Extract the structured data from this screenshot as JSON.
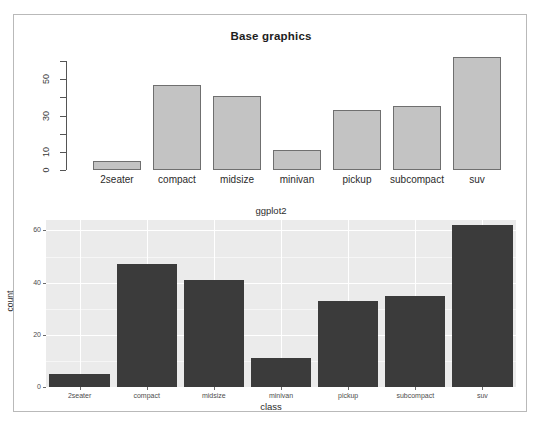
{
  "figure": {
    "background": "#ffffff",
    "frame_color": "#b9b9b9"
  },
  "chart_data": [
    {
      "type": "bar",
      "title": "Base graphics",
      "xlabel": "",
      "ylabel": "",
      "categories": [
        "2seater",
        "compact",
        "midsize",
        "minivan",
        "pickup",
        "subcompact",
        "suv"
      ],
      "values": [
        5,
        47,
        41,
        11,
        33,
        35,
        62
      ],
      "ylim": [
        0,
        60
      ],
      "ytick_values": [
        0,
        10,
        20,
        30,
        40,
        50,
        60
      ],
      "ytick_labels": [
        "0",
        "10",
        "",
        "30",
        "",
        "50",
        ""
      ],
      "grid": false,
      "legend": "none",
      "bar_fill": "#c3c3c3",
      "bar_border": "#6f6f6f",
      "style": "r-base-graphics"
    },
    {
      "type": "bar",
      "title": "ggplot2",
      "xlabel": "class",
      "ylabel": "count",
      "categories": [
        "2seater",
        "compact",
        "midsize",
        "minivan",
        "pickup",
        "subcompact",
        "suv"
      ],
      "values": [
        5,
        47,
        41,
        11,
        33,
        35,
        62
      ],
      "ylim": [
        0,
        64
      ],
      "ytick_values": [
        0,
        20,
        40,
        60
      ],
      "ytick_labels": [
        "0",
        "20",
        "40",
        "60"
      ],
      "grid": true,
      "legend": "none",
      "panel_background": "#ebebeb",
      "grid_color": "#ffffff",
      "bar_fill": "#3b3b3b",
      "style": "ggplot2-theme-grey"
    }
  ]
}
